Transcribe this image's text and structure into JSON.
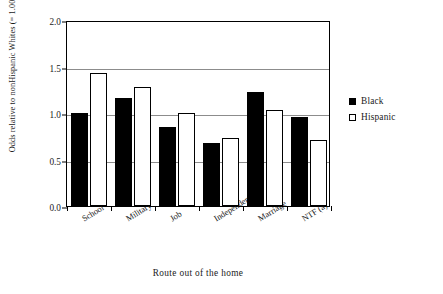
{
  "chart_data": {
    "type": "bar",
    "title": "",
    "xlabel": "Route out of the home",
    "ylabel": "Odds relative to nonHispanic Whites (= 1.00)",
    "categories": [
      "School",
      "Military",
      "Job",
      "Independence",
      "Marriage",
      "NTF (a)"
    ],
    "series": [
      {
        "name": "Black",
        "values": [
          1.0,
          1.16,
          0.85,
          0.68,
          1.23,
          0.96
        ]
      },
      {
        "name": "Hispanic",
        "values": [
          1.43,
          1.28,
          1.0,
          0.73,
          1.03,
          0.71
        ]
      }
    ],
    "ylim": [
      0.0,
      2.0
    ],
    "yticks": [
      "0.0",
      "0.5",
      "1.0",
      "1.5",
      "2.0"
    ],
    "ytick_values": [
      0.0,
      0.5,
      1.0,
      1.5,
      2.0
    ],
    "grid": true,
    "legend_position": "right"
  },
  "legend": {
    "entries": [
      {
        "label": "Black",
        "swatch": "filled-black-square"
      },
      {
        "label": "Hispanic",
        "swatch": "hollow-white-square"
      }
    ]
  }
}
